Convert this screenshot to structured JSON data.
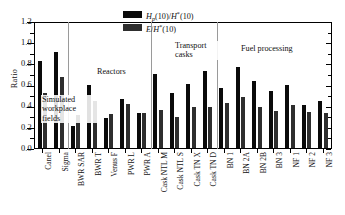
{
  "chart_data": {
    "type": "bar",
    "title": "",
    "xlabel": "",
    "ylabel": "Ratio",
    "ylim": [
      0.0,
      1.2
    ],
    "yticks": [
      "0.0",
      "0.2",
      "0.4",
      "0.6",
      "0.8",
      "1.0",
      "1.2"
    ],
    "grid": false,
    "legend_position": "top-center",
    "categories": [
      "Canel",
      "Sigma",
      "BWR SAR",
      "BWR T",
      "Venus F",
      "PWR L",
      "PWR A",
      "Cask NTL M",
      "Cask NTL S",
      "Cask TN X",
      "Cask TN D",
      "BN 1",
      "BN 2A",
      "BN 2B",
      "BN 3",
      "NF 1",
      "NF 2",
      "NF 3"
    ],
    "series": [
      {
        "name": "Hp(10)/H*(10)",
        "color": "#0a0a0a",
        "values": [
          0.82,
          0.905,
          0.21,
          0.595,
          0.285,
          0.465,
          0.335,
          0.695,
          0.52,
          0.605,
          0.725,
          0.565,
          0.77,
          0.635,
          0.535,
          0.6,
          0.41,
          0.44
        ]
      },
      {
        "name": "E/H*(10)",
        "color": "#2e2e2e",
        "values": [
          0.52,
          0.67,
          0.31,
          0.445,
          0.32,
          0.42,
          0.335,
          0.355,
          0.29,
          0.385,
          0.39,
          0.425,
          0.48,
          0.385,
          0.35,
          0.405,
          0.34,
          0.33
        ]
      }
    ],
    "annotations": [
      {
        "id": "simulated-workplace-fields",
        "text": "Simulated workplace fields"
      },
      {
        "id": "reactors",
        "text": "Reactors"
      },
      {
        "id": "transport-casks",
        "text": "Transport casks"
      },
      {
        "id": "fuel-processing",
        "text": "Fuel processing"
      }
    ],
    "group_separators": [
      2,
      7,
      11
    ]
  },
  "legend": {
    "series1": {
      "base": "H",
      "sub": "p",
      "mid": "(10)/",
      "italic2": "H",
      "sup": "*",
      "tail": "(10)"
    },
    "series2": {
      "base": "E",
      "slash": "/",
      "italic2": "H",
      "sup": "*",
      "tail": "(10)"
    }
  },
  "annotations": {
    "simulated_line1": "Simulated",
    "simulated_line2": "workplace",
    "simulated_line3": "fields",
    "reactors": "Reactors",
    "transport_line1": "Transport",
    "transport_line2": "casks",
    "fuel": "Fuel processing"
  }
}
